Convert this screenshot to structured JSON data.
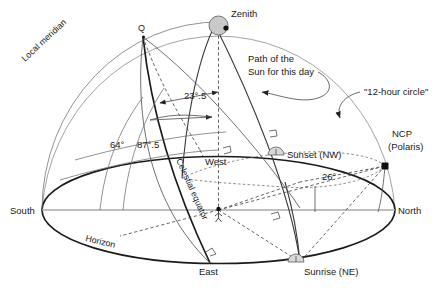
{
  "figure": {
    "background_color": "#ffffff",
    "line_color": "#1a1a1a"
  },
  "labels": {
    "zenith": "Zenith",
    "q_point": "Q",
    "local_meridian": "Local meridian",
    "path_of_sun_line1": "Path of the",
    "path_of_sun_line2": "Sun for this day",
    "twelve_hour_circle": "\"12-hour  circle\"",
    "ncp_line1": "NCP",
    "ncp_line2": "(Polaris)",
    "celestial_equator": "Celestial equator",
    "horizon": "Horizon",
    "south": "South",
    "north": "North",
    "east": "East",
    "west": "West",
    "sunset": "Sunset (NW)",
    "sunrise": "Sunrise (NE)"
  },
  "angles": {
    "obliquity": "23°.5",
    "altitude_equator": "64°",
    "altitude_sun": "87°.5",
    "azimuth_amplitude": "26°"
  },
  "geometry": {
    "south_point": "South",
    "north_point": "North",
    "east_point": "East",
    "west_point": "West"
  }
}
